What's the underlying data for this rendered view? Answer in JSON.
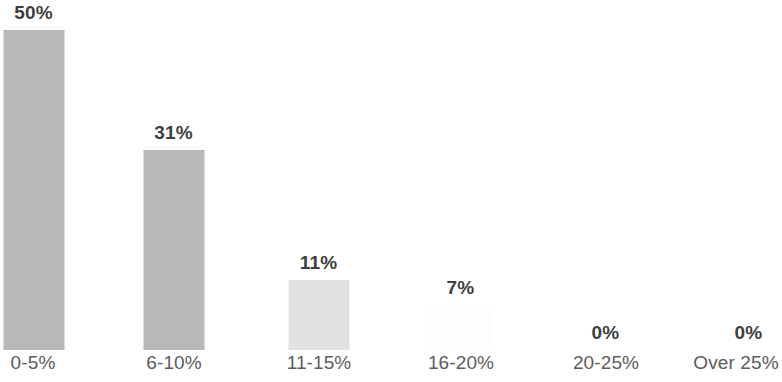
{
  "chart_data": {
    "type": "bar",
    "title": "",
    "subtitle": "",
    "xlabel": "",
    "ylabel": "",
    "categories": [
      "0-5%",
      "6-10%",
      "11-15%",
      "16-20%",
      "20-25%",
      "Over 25%"
    ],
    "values": [
      50,
      31,
      11,
      7,
      0,
      0
    ],
    "value_labels": [
      "50%",
      "31%",
      "11%",
      "7%",
      "0%",
      "0%"
    ],
    "ylim": [
      0,
      57
    ],
    "grid": false,
    "legend": null,
    "axis_lines": false,
    "bar_colors": [
      "#b9b9b9",
      "#b9b9b9",
      "#e2e2e2",
      "#fdfdfd",
      "#b9b9b9",
      "#b9b9b9"
    ],
    "label_color": "#3f3f3f",
    "tick_label_color": "#5c5c5c",
    "background_color": "#ffffff"
  },
  "bars": [
    {
      "category": "0-5%",
      "value_label": "50%",
      "bar_left": 3,
      "bar_height": 320,
      "label_bottom": 326,
      "center": 33,
      "tone": "",
      "name": "bar-0-5"
    },
    {
      "category": "6-10%",
      "value_label": "31%",
      "bar_left": 143,
      "bar_height": 200,
      "label_bottom": 206,
      "center": 174,
      "tone": "",
      "name": "bar-6-10"
    },
    {
      "category": "11-15%",
      "value_label": "11%",
      "bar_left": 288,
      "bar_height": 70,
      "label_bottom": 76,
      "center": 319,
      "tone": "light",
      "name": "bar-11-15"
    },
    {
      "category": "16-20%",
      "value_label": "7%",
      "bar_left": 430,
      "bar_height": 45,
      "label_bottom": 51,
      "center": 461,
      "tone": "blank",
      "name": "bar-16-20"
    },
    {
      "category": "20-25%",
      "value_label": "0%",
      "bar_left": 575,
      "bar_height": 0,
      "label_bottom": 6,
      "center": 606,
      "tone": "zero",
      "name": "bar-20-25"
    },
    {
      "category": "Over 25%",
      "value_label": "0%",
      "bar_left": 718,
      "bar_height": 0,
      "label_bottom": 6,
      "center": 736,
      "tone": "zero",
      "name": "bar-over-25"
    }
  ]
}
